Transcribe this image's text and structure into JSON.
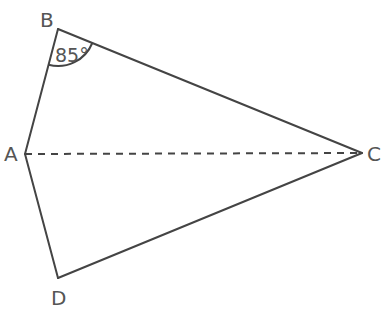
{
  "diagram": {
    "type": "quadrilateral",
    "shape": "kite",
    "vertices": {
      "A": {
        "label": "A",
        "x": 25,
        "y": 154
      },
      "B": {
        "label": "B",
        "x": 58,
        "y": 29
      },
      "C": {
        "label": "C",
        "x": 362,
        "y": 153
      },
      "D": {
        "label": "D",
        "x": 58,
        "y": 278
      }
    },
    "edges": [
      {
        "from": "A",
        "to": "B",
        "style": "solid"
      },
      {
        "from": "B",
        "to": "C",
        "style": "solid"
      },
      {
        "from": "C",
        "to": "D",
        "style": "solid"
      },
      {
        "from": "D",
        "to": "A",
        "style": "solid"
      }
    ],
    "diagonals": [
      {
        "from": "A",
        "to": "C",
        "style": "dashed"
      }
    ],
    "angles": [
      {
        "vertex": "B",
        "between": [
          "A",
          "C"
        ],
        "value": "85°"
      }
    ],
    "colors": {
      "stroke": "#444444",
      "text": "#555555",
      "background": "#ffffff"
    }
  }
}
